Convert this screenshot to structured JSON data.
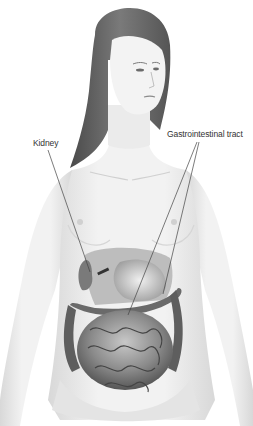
{
  "diagram": {
    "labels": [
      {
        "id": "kidney",
        "text": "Kidney",
        "x": 33,
        "y": 138,
        "pointer": [
          {
            "from": [
              48,
              150
            ],
            "to": [
              90,
              272
            ]
          }
        ]
      },
      {
        "id": "gi",
        "text": "Gastrointestinal tract",
        "x": 167,
        "y": 129,
        "pointer": [
          {
            "from": [
              197,
              142
            ],
            "to": [
              128,
              315
            ]
          },
          {
            "from": [
              199,
              142
            ],
            "to": [
              163,
              294
            ]
          }
        ]
      }
    ],
    "colors": {
      "background": "#ffffff",
      "skin": "#eeeeee",
      "skin_shadow": "#d4d4d4",
      "hair": "#6e6e6e",
      "hair_dark": "#4a4a4a",
      "organ": "#8a8a8a",
      "organ_dark": "#4e4e4e",
      "line": "#444444",
      "text": "#333333"
    }
  }
}
